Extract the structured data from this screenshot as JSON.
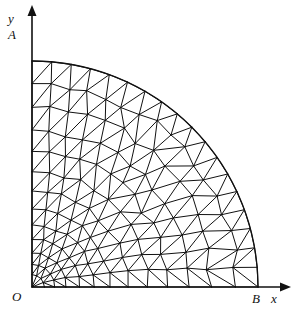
{
  "figure": {
    "background_color": "#ffffff",
    "line_color": "#111111",
    "labels": {
      "y_axis": "y",
      "x_axis": "x",
      "origin": "O",
      "point_a": "A",
      "point_b": "B"
    }
  },
  "chart_data": {
    "type": "diagram",
    "xlabel": "x",
    "ylabel": "y",
    "annotations": [
      "O",
      "A",
      "B",
      "x",
      "y"
    ],
    "geometry": {
      "origin_px": [
        32,
        287
      ],
      "point_a_px": [
        32,
        32
      ],
      "point_b_px": [
        258,
        287
      ],
      "radius_px": 226,
      "quadrant": "first",
      "arc_start_angle_deg": 0,
      "arc_end_angle_deg": 90
    },
    "mesh": {
      "element_type": "triangle",
      "radial_rings": 13,
      "angular_divisions_outer": 18,
      "refinement": "graded toward origin",
      "ring_radius_fractions": [
        0.055,
        0.1,
        0.15,
        0.21,
        0.275,
        0.345,
        0.425,
        0.51,
        0.6,
        0.695,
        0.795,
        0.9,
        1.0
      ],
      "ring_angular_counts": [
        4,
        5,
        6,
        7,
        8,
        9,
        10,
        11,
        13,
        14,
        15,
        17,
        18
      ]
    },
    "axes": {
      "x_axis_px": [
        [
          32,
          287
        ],
        [
          282,
          287
        ]
      ],
      "y_axis_px": [
        [
          32,
          287
        ],
        [
          32,
          14
        ]
      ],
      "arrowheads": [
        "x-positive",
        "y-positive"
      ],
      "grid": false,
      "legend": null
    }
  }
}
